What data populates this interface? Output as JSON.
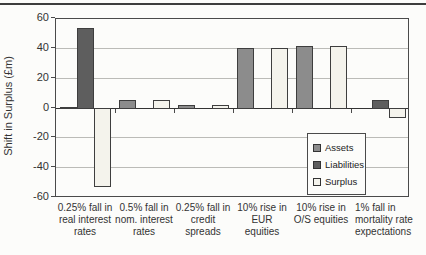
{
  "page": {
    "background": "#fcfcfa",
    "top_rule_color": "#3d3d3d"
  },
  "chart_data": {
    "type": "bar",
    "title": "",
    "xlabel": "",
    "ylabel": "Shift in Surplus (£m)",
    "ylim": [
      -60,
      60
    ],
    "yticks": [
      60,
      40,
      20,
      0,
      -20,
      -40,
      -60
    ],
    "grid": true,
    "legend_position": "inside-bottom-right",
    "categories": [
      "0.25% fall in\nreal interest\nrates",
      "0.5% fall in\nnom. interest\nrates",
      "0.25% fall in\ncredit\nspreads",
      "10% rise in\nEUR\nequities",
      "10% rise in\nO/S equities",
      "1% fall in\nmortality rate\nexpectations"
    ],
    "series": [
      {
        "name": "Assets",
        "color": "#8c8c8c",
        "values": [
          1,
          6,
          3,
          41,
          42,
          0
        ]
      },
      {
        "name": "Liabilities",
        "color": "#5e5e5e",
        "values": [
          54,
          0,
          0,
          0,
          0,
          6
        ]
      },
      {
        "name": "Surplus",
        "color": "#f4f3ec",
        "values": [
          -53,
          6,
          3,
          41,
          42,
          -7
        ]
      }
    ],
    "bar_border_color": "#3e3e3e"
  }
}
